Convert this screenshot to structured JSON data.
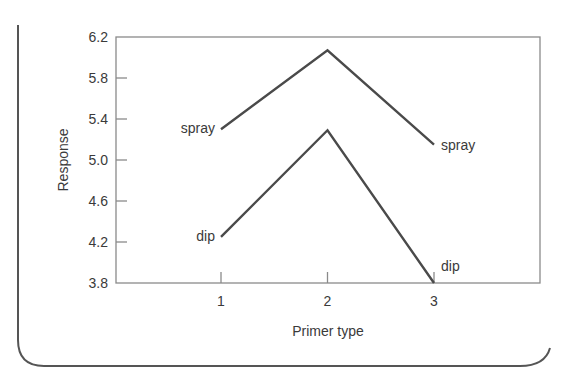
{
  "chart_data": {
    "type": "line",
    "title": "",
    "xlabel": "Primer type",
    "ylabel": "Response",
    "categories": [
      "1",
      "2",
      "3"
    ],
    "x": [
      1,
      2,
      3
    ],
    "xlim": [
      0,
      4
    ],
    "ylim": [
      3.8,
      6.2
    ],
    "yticks": [
      "6.2",
      "5.8",
      "5.4",
      "5.0",
      "4.6",
      "4.2",
      "3.8"
    ],
    "ytick_values": [
      6.2,
      5.8,
      5.4,
      5.0,
      4.6,
      4.2,
      3.8
    ],
    "xticks": [
      "1",
      "2",
      "3"
    ],
    "grid": false,
    "legend": "none (series labeled directly at line ends)",
    "series": [
      {
        "name": "spray",
        "values": [
          5.3,
          6.07,
          5.15
        ],
        "start_label": "spray",
        "end_label": "spray"
      },
      {
        "name": "dip",
        "values": [
          4.25,
          5.29,
          3.8
        ],
        "start_label": "dip",
        "end_label": "dip"
      }
    ],
    "colors": {
      "line": "#4a4a4a",
      "axis": "#8a8a8a",
      "frame": "#555555"
    }
  }
}
